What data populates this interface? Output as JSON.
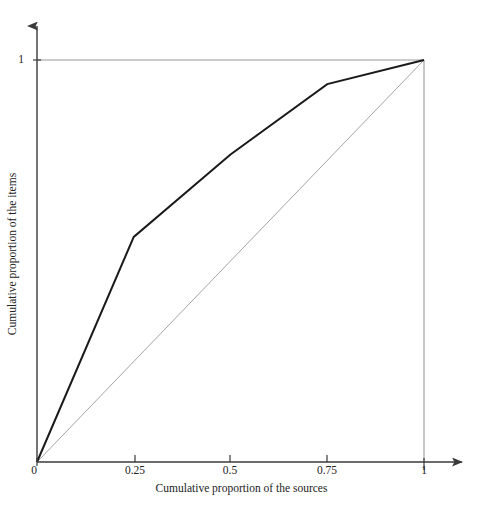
{
  "chart_data": {
    "type": "line",
    "title": "",
    "subtitle": "",
    "xlabel": "Cumulative proportion of the sources",
    "ylabel": "Cumulative proportion of the items",
    "xlim": [
      0,
      1
    ],
    "ylim": [
      0,
      1
    ],
    "xticks": [
      "0",
      "0.25",
      "0.5",
      "0.75",
      "1"
    ],
    "xtick_values": [
      0,
      0.25,
      0.5,
      0.75,
      1
    ],
    "yticks": [
      "0",
      "1"
    ],
    "ytick_values": [
      0,
      1
    ],
    "grid": false,
    "legend": "none",
    "series": [
      {
        "name": "Lorenz curve",
        "color": "#1a1a1a",
        "width": 2.0,
        "x": [
          0,
          0.25,
          0.5,
          0.75,
          1
        ],
        "values": [
          0,
          0.56,
          0.765,
          0.94,
          1
        ]
      },
      {
        "name": "Line of equality",
        "color": "#9a9a9a",
        "width": 0.9,
        "x": [
          0,
          1
        ],
        "values": [
          0,
          1
        ]
      }
    ],
    "annotations": [
      {
        "name": "top-border",
        "from": [
          0,
          1
        ],
        "to": [
          1,
          1
        ],
        "color": "#9a9a9a"
      },
      {
        "name": "right-border",
        "from": [
          1,
          1
        ],
        "to": [
          1,
          0
        ],
        "color": "#9a9a9a"
      }
    ]
  },
  "axes": {
    "x_title": "Cumulative proportion of the sources",
    "y_title": "Cumulative proportion of the items",
    "x_tick_labels": [
      "0",
      "0.25",
      "0.5",
      "0.75",
      "1"
    ],
    "y_tick_labels": [
      "1",
      "0"
    ],
    "axis_color": "#3a3a3a",
    "frame_color": "#9a9a9a"
  },
  "colors": {
    "background": "#ffffff",
    "curve": "#1a1a1a",
    "diagonal": "#9a9a9a",
    "axis": "#3a3a3a",
    "text": "#222222"
  }
}
